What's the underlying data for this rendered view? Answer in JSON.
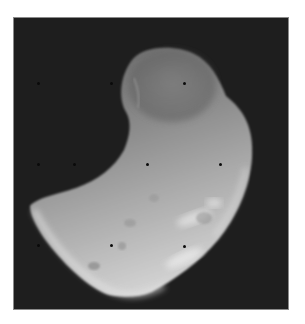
{
  "image": {
    "subject": "irregular grayscale moon / asteroid body",
    "background_color": "#1e1e1e",
    "frame_border_color": "#8a8a8a",
    "page_background": "#ffffff",
    "body_tone_dark": "#6e6e6e",
    "body_tone_mid": "#a8a8a8",
    "body_tone_light": "#dcdcdc"
  },
  "reseau_marks": [
    {
      "x": 24,
      "y": 65
    },
    {
      "x": 97,
      "y": 65
    },
    {
      "x": 170,
      "y": 65
    },
    {
      "x": 24,
      "y": 146
    },
    {
      "x": 60,
      "y": 146
    },
    {
      "x": 133,
      "y": 146
    },
    {
      "x": 206,
      "y": 146
    },
    {
      "x": 24,
      "y": 227
    },
    {
      "x": 97,
      "y": 227
    },
    {
      "x": 170,
      "y": 228
    }
  ]
}
